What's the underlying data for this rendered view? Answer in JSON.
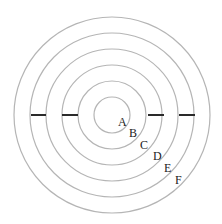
{
  "diagram": {
    "type": "concentric-circles",
    "center": {
      "x": 112,
      "y": 115
    },
    "ring_color": "#b5b5b5",
    "bar_color": "#2a2a2a",
    "rings": [
      {
        "id": "ring-1",
        "r": 18
      },
      {
        "id": "ring-2",
        "r": 34
      },
      {
        "id": "ring-3",
        "r": 50
      },
      {
        "id": "ring-4",
        "r": 66
      },
      {
        "id": "ring-5",
        "r": 82
      },
      {
        "id": "ring-6",
        "r": 98
      }
    ],
    "bars": [
      {
        "id": "left-outer-bar",
        "x1": 31,
        "x2": 46,
        "y": 115
      },
      {
        "id": "left-inner-bar",
        "x1": 62,
        "x2": 78,
        "y": 115
      },
      {
        "id": "right-inner-bar",
        "x1": 148,
        "x2": 164,
        "y": 115
      },
      {
        "id": "right-outer-bar",
        "x1": 179,
        "x2": 195,
        "y": 115
      }
    ],
    "labels": [
      {
        "text": "A",
        "x": 118,
        "y": 126
      },
      {
        "text": "B",
        "x": 129,
        "y": 137
      },
      {
        "text": "C",
        "x": 140,
        "y": 149
      },
      {
        "text": "D",
        "x": 153,
        "y": 160
      },
      {
        "text": "E",
        "x": 164,
        "y": 172
      },
      {
        "text": "F",
        "x": 175,
        "y": 184
      }
    ]
  }
}
